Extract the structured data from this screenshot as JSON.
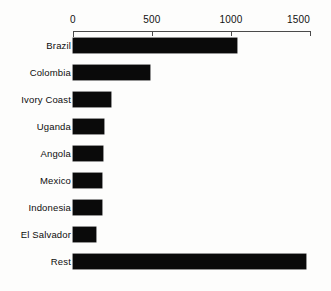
{
  "chart_data": {
    "type": "bar",
    "orientation": "horizontal",
    "title": "",
    "xlabel": "",
    "ylabel": "",
    "xlim": [
      0,
      1500
    ],
    "grid": false,
    "legend": null,
    "axis_position": "top",
    "bar_color": "#0a0a0a",
    "background_color": "#fdfdfc",
    "tick_values": [
      0,
      500,
      1000,
      1500
    ],
    "tick_labels": [
      "0",
      "500",
      "1000",
      "1500"
    ],
    "categories": [
      "Brazil",
      "Colombia",
      "Ivory Coast",
      "Uganda",
      "Angola",
      "Mexico",
      "Indonesia",
      "El Salvador",
      "Rest"
    ],
    "values": [
      1040,
      487,
      240,
      196,
      190,
      185,
      182,
      145,
      1475
    ]
  }
}
